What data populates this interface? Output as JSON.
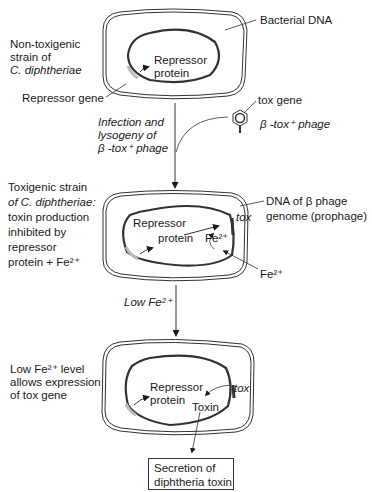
{
  "diagram": {
    "stages": [
      {
        "id": "stage1",
        "description": [
          "Non-toxigenic",
          "strain of",
          "C. diphtheriae"
        ],
        "labels": {
          "bacterial_dna": "Bacterial DNA",
          "repressor_protein": [
            "Repressor",
            "protein"
          ],
          "repressor_gene": "Repressor gene"
        }
      },
      {
        "id": "transition1",
        "description": [
          "Infection and",
          "lysogeny of",
          "β -tox⁺ phage"
        ],
        "phage": {
          "tox_gene_label": "tox gene",
          "phage_label": "β -tox⁺ phage"
        }
      },
      {
        "id": "stage2",
        "description": [
          "Toxigenic strain",
          "of C. diphtheriae:",
          "toxin production",
          "inhibited by",
          "repressor",
          "protein + Fe²⁺"
        ],
        "labels": {
          "phage_dna": [
            "DNA of β phage",
            "genome (prophage)"
          ],
          "tox": "tox",
          "repressor_protein": [
            "Repressor",
            "protein"
          ],
          "fe_inner": "Fe²⁺",
          "fe_outer": "Fe²⁺"
        }
      },
      {
        "id": "transition2",
        "description": "Low Fe²⁺"
      },
      {
        "id": "stage3",
        "description": [
          "Low Fe²⁺ level",
          "allows expression",
          "of tox gene"
        ],
        "labels": {
          "repressor_protein": [
            "Repressor",
            "protein"
          ],
          "tox": "tox",
          "toxin": "Toxin"
        }
      }
    ],
    "output_box": [
      "Secretion of",
      "diphtheria toxin"
    ],
    "colors": {
      "line": "#1a1a1a",
      "background": "#ffffff"
    }
  }
}
